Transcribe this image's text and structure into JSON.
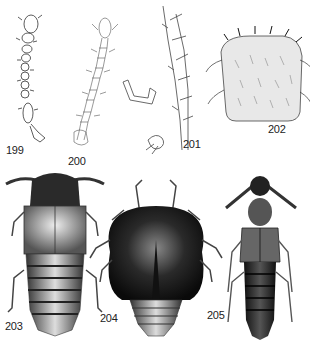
{
  "figures": [
    {
      "id": "199",
      "label": "199",
      "subject": "antenna"
    },
    {
      "id": "200",
      "label": "200",
      "subject": "antenna"
    },
    {
      "id": "201",
      "label": "201",
      "subject": "leg-with-spines-and-tarsal-claw"
    },
    {
      "id": "202",
      "label": "202",
      "subject": "setose-plate"
    },
    {
      "id": "203",
      "label": "203",
      "subject": "rove-beetle-dorsal-habitus"
    },
    {
      "id": "204",
      "label": "204",
      "subject": "rounded-beetle-dorsal-habitus"
    },
    {
      "id": "205",
      "label": "205",
      "subject": "rove-beetle-dorsal-habitus"
    }
  ],
  "colors": {
    "ink": "#222222",
    "dark_body": "#1a1a1a",
    "mid_gray": "#777777",
    "light_gray": "#cfcfcf",
    "background": "#ffffff"
  }
}
